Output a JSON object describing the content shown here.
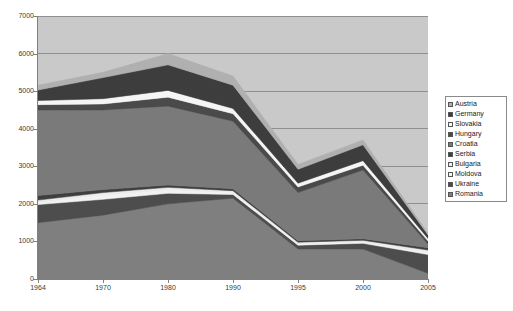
{
  "chart_data": {
    "type": "area",
    "stacked": true,
    "title": "",
    "subtitle": "",
    "xlabel": "",
    "ylabel": "",
    "grid": true,
    "legend_position": "right",
    "xlim": [
      0,
      6
    ],
    "ylim": [
      0,
      7000
    ],
    "y_ticks": [
      0,
      1000,
      2000,
      3000,
      4000,
      5000,
      6000,
      7000
    ],
    "categories": [
      "1964",
      "1970",
      "1980",
      "1990",
      "1995",
      "2000",
      "2005"
    ],
    "series": [
      {
        "name": "Romania",
        "color": "#7f7f7f",
        "values": [
          1500,
          1700,
          2000,
          2150,
          800,
          800,
          150
        ]
      },
      {
        "name": "Ukraine",
        "color": "#4d4d4d",
        "values": [
          480,
          420,
          280,
          100,
          100,
          150,
          500
        ]
      },
      {
        "name": "Moldova",
        "color": "#f2f2f2",
        "values": [
          60,
          120,
          100,
          60,
          40,
          40,
          60
        ]
      },
      {
        "name": "Bulgaria",
        "color": "#ededed",
        "values": [
          60,
          60,
          60,
          40,
          40,
          40,
          60
        ]
      },
      {
        "name": "Serbia",
        "color": "#3f3f3f",
        "values": [
          120,
          80,
          60,
          50,
          40,
          40,
          60
        ]
      },
      {
        "name": "Croatia",
        "color": "#7a7a7a",
        "values": [
          2280,
          2120,
          2100,
          1800,
          1280,
          1830,
          100
        ]
      },
      {
        "name": "Hungary",
        "color": "#4a4a4a",
        "values": [
          140,
          160,
          240,
          200,
          150,
          130,
          80
        ]
      },
      {
        "name": "Slovakia",
        "color": "#f5f5f5",
        "values": [
          110,
          140,
          180,
          140,
          100,
          120,
          70
        ]
      },
      {
        "name": "Germany",
        "color": "#3d3d3d",
        "values": [
          280,
          560,
          680,
          620,
          370,
          420,
          90
        ]
      },
      {
        "name": "Austria",
        "color": "#b0b0b0",
        "values": [
          130,
          140,
          300,
          240,
          130,
          130,
          50
        ]
      }
    ]
  },
  "axes": {
    "y_tick_labels": [
      "7000",
      "6000",
      "5000",
      "4000",
      "3000",
      "2000",
      "1000",
      "0"
    ],
    "x_tick_labels": [
      "1964",
      "1970",
      "1980",
      "1990",
      "1995",
      "2000",
      "2005"
    ]
  },
  "legend": {
    "items": [
      {
        "label": "Austria",
        "swatch": "#b0b0b0"
      },
      {
        "label": "Germany",
        "swatch": "#3d3d3d"
      },
      {
        "label": "Slovakia",
        "swatch": "#f5f5f5"
      },
      {
        "label": "Hungary",
        "swatch": "#4a4a4a"
      },
      {
        "label": "Croatia",
        "swatch": "#7a7a7a"
      },
      {
        "label": "Serbia",
        "swatch": "#3f3f3f"
      },
      {
        "label": "Bulgaria",
        "swatch": "#ededed"
      },
      {
        "label": "Moldova",
        "swatch": "#f2f2f2"
      },
      {
        "label": "Ukraine",
        "swatch": "#4d4d4d"
      },
      {
        "label": "Romania",
        "swatch": "#7f7f7f"
      }
    ]
  },
  "style": {
    "plot_background": "#c9c9c9",
    "gridline_color": "#8f8f8f",
    "axis_color": "#808080",
    "page_background": "#ffffff"
  }
}
